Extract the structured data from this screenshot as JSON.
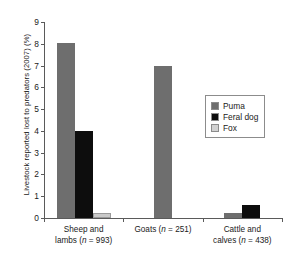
{
  "chart_data": {
    "type": "bar",
    "title": "",
    "xlabel": "",
    "ylabel": "Livestock reported lost to predators (2007) (%)",
    "ylim": [
      0,
      9
    ],
    "yticks": [
      "0",
      "1",
      "2",
      "3",
      "4",
      "5",
      "6",
      "7",
      "8",
      "9"
    ],
    "grid": false,
    "legend_position": "center-right",
    "categories": [
      "Sheep and lambs (n = 993)",
      "Goats (n = 251)",
      "Cattle and calves (n = 438)"
    ],
    "category_lines": [
      [
        "Sheep and",
        "lambs (n = 993)"
      ],
      [
        "Goats (n = 251)",
        ""
      ],
      [
        "Cattle and",
        "calves (n = 438)"
      ]
    ],
    "series": [
      {
        "name": "Puma",
        "color": "#6e6e6e",
        "values": [
          8.05,
          7.0,
          0.25
        ]
      },
      {
        "name": "Feral dog",
        "color": "#0d0d0d",
        "values": [
          4.0,
          0.0,
          0.6
        ]
      },
      {
        "name": "Fox",
        "color": "#c9c9c9",
        "values": [
          0.25,
          0.0,
          0.0
        ]
      }
    ]
  },
  "legend": {
    "items": [
      {
        "label": "Puma"
      },
      {
        "label": "Feral dog"
      },
      {
        "label": "Fox"
      }
    ]
  },
  "axis": {
    "y_title": "Livestock reported lost to predators (2007) (%)"
  }
}
